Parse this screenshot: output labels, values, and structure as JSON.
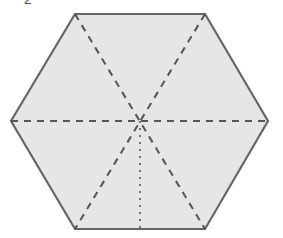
{
  "figure": {
    "shape": "regular hexagon",
    "label_fragment": "2",
    "colors": {
      "fill": "#e6e6e6",
      "outline": "#666666",
      "dashed_line": "#555555",
      "dotted_line": "#666666"
    },
    "lines": [
      {
        "name": "horizontal-diagonal",
        "style": "dashed",
        "from": "left-vertex",
        "to": "right-vertex"
      },
      {
        "name": "diagonal-top-left-bottom-right",
        "style": "dashed",
        "from": "top-left-vertex",
        "to": "bottom-right-vertex"
      },
      {
        "name": "diagonal-top-right-bottom-left",
        "style": "dashed",
        "from": "top-right-vertex",
        "to": "bottom-left-vertex"
      },
      {
        "name": "center-to-bottom-edge",
        "style": "dotted",
        "from": "center",
        "to": "bottom-edge-midpoint"
      }
    ]
  }
}
